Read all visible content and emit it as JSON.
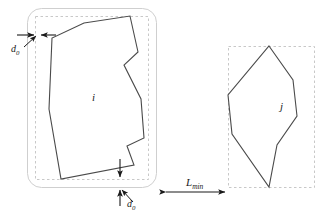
{
  "figure": {
    "type": "diagram",
    "background_color": "#ffffff",
    "stroke_color": "#3a3a3a",
    "dashed_color": "#b0b0b0",
    "offset_color": "#cccccc",
    "text_color": "#1a1a1a",
    "width": 330,
    "height": 218
  },
  "labels": {
    "shape_i": "i",
    "shape_j": "j",
    "clearance_top": "d",
    "clearance_top_sub": "0",
    "clearance_bottom": "d",
    "clearance_bottom_sub": "0",
    "separation": "L",
    "separation_sub": "min"
  },
  "shapes": {
    "polygon_i": {
      "name": "i",
      "convex": false,
      "points": "84,23 130,16 138,52 124,65 141,99 144,138 127,146 134,165 61,179 49,109 52,38"
    },
    "polygon_j": {
      "name": "j",
      "convex": true,
      "points": "269,46 293,80 297,116 277,145 269,187 232,134 228,95"
    },
    "bbox_i": {
      "x": 35,
      "y": 16,
      "width": 113,
      "height": 163
    },
    "bbox_j": {
      "x": 228,
      "y": 46,
      "width": 86,
      "height": 141
    },
    "offset_region_i": {
      "x": 27,
      "y": 8,
      "width": 129,
      "height": 179,
      "radius": 14
    }
  },
  "annotations": {
    "clearance_top": {
      "arrow_left_from": [
        18,
        35
      ],
      "arrow_left_to": [
        36,
        35
      ],
      "arrow_right_from": [
        55,
        35
      ],
      "arrow_right_to": [
        40,
        35
      ],
      "leader_from": [
        25,
        48
      ],
      "leader_to": [
        36,
        37
      ],
      "label_x": 12,
      "label_y": 45
    },
    "clearance_bottom": {
      "arrow_down_from": [
        120,
        160
      ],
      "arrow_down_to": [
        120,
        177
      ],
      "arrow_up_from": [
        120,
        205
      ],
      "arrow_up_to": [
        120,
        190
      ],
      "leader_from": [
        133,
        203
      ],
      "leader_to": [
        122,
        189
      ],
      "label_x": 128,
      "label_y": 202
    },
    "separation": {
      "arrow_from": [
        164,
        192
      ],
      "arrow_to": [
        227,
        192
      ],
      "label_x": 186,
      "label_y": 178
    }
  }
}
